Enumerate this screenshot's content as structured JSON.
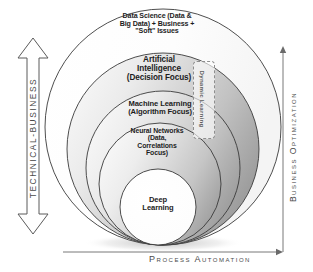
{
  "diagram": {
    "rings": [
      {
        "id": "data-science",
        "lines": [
          "Data Science (Data &",
          "Big Data) + Business +",
          "\"Soft\" Issues"
        ],
        "fill": "#ffffff"
      },
      {
        "id": "artificial-intelligence",
        "lines": [
          "Artificial",
          "Intelligence",
          "(Decision Focus)"
        ],
        "fill": "#d3d3d3"
      },
      {
        "id": "machine-learning",
        "lines": [
          "Machine Learning",
          "(Algorithm Focus)"
        ],
        "fill": "#cfcfcf"
      },
      {
        "id": "neural-networks",
        "lines": [
          "Neural Networks",
          "(Data,",
          "Correlations",
          "Focus)"
        ],
        "fill": "#c8c8c8"
      },
      {
        "id": "deep-learning",
        "lines": [
          "Deep",
          "Learning"
        ],
        "fill": "#ffffff"
      }
    ],
    "callout": {
      "label": "Dynamic Learning"
    },
    "axes": {
      "left": {
        "label": "TECHNICAL-BUSINESS",
        "icon": "double-headed-vertical-arrow"
      },
      "right": {
        "label": "Business Optimization",
        "icon": "up-arrow"
      },
      "bottom": {
        "label": "Process Automation",
        "icon": "right-arrow"
      }
    },
    "colors": {
      "outline": "#3a3a3a",
      "shade_light": "#f2f2f2",
      "shade_dark": "#a3a3a3",
      "text": "#1d1d1d",
      "axis_text": "#4a4a4a",
      "dashed_border": "#8e8e8e"
    }
  }
}
